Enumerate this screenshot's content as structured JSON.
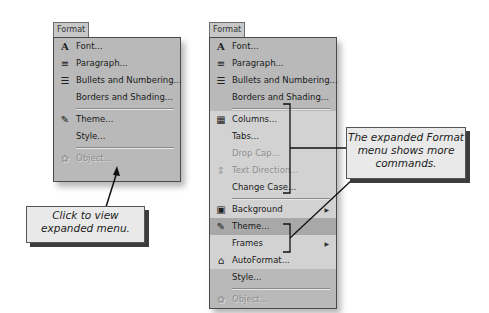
{
  "left_menu": {
    "title": "Format",
    "items": [
      {
        "label": "Font...",
        "icon": "font-A-icon",
        "glyph": "A"
      },
      {
        "label": "Paragraph...",
        "icon": "paragraph-icon",
        "glyph": "≡"
      },
      {
        "label": "Bullets and Numbering...",
        "icon": "bullets-icon",
        "glyph": "☰"
      },
      {
        "label": "Borders and Shading..."
      },
      {
        "label": "Theme...",
        "icon": "theme-icon",
        "glyph": "✎"
      },
      {
        "label": "Style..."
      },
      {
        "label": "Object...",
        "icon": "object-icon",
        "glyph": "✿",
        "disabled": true
      }
    ],
    "expand_glyph": "»"
  },
  "right_menu": {
    "title": "Format",
    "items": [
      {
        "label": "Font...",
        "glyph": "A"
      },
      {
        "label": "Paragraph...",
        "glyph": "≡"
      },
      {
        "label": "Bullets and Numbering...",
        "glyph": "☰"
      },
      {
        "label": "Borders and Shading..."
      },
      {
        "label": "Columns...",
        "glyph": "▦"
      },
      {
        "label": "Tabs..."
      },
      {
        "label": "Drop Cap...",
        "disabled": true
      },
      {
        "label": "Text Direction...",
        "glyph": "⇕",
        "disabled": true
      },
      {
        "label": "Change Case..."
      },
      {
        "label": "Background",
        "glyph": "▣",
        "submenu": "▶"
      },
      {
        "label": "Theme...",
        "glyph": "✎"
      },
      {
        "label": "Frames",
        "submenu": "▶"
      },
      {
        "label": "AutoFormat...",
        "glyph": "⌂"
      },
      {
        "label": "Style..."
      },
      {
        "label": "Object...",
        "glyph": "✿",
        "disabled": true
      }
    ]
  },
  "callouts": {
    "left": "Click to view expanded menu.",
    "right": "The expanded Format menu shows more commands."
  }
}
